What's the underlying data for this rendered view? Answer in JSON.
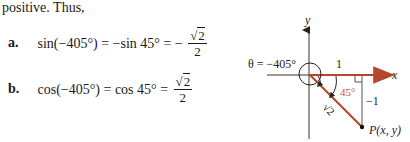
{
  "text": {
    "intro": "positive. Thus,",
    "equations": [
      {
        "label": "a.",
        "lhs": "sin(−405°) = −sin 45° = −",
        "frac_num_radical": "√",
        "frac_num_value": "2",
        "frac_den": "2"
      },
      {
        "label": "b.",
        "lhs": "cos(−405°) = cos 45° = ",
        "frac_num_radical": "√",
        "frac_num_value": "2",
        "frac_den": "2"
      }
    ]
  },
  "figure": {
    "theta_label": "θ = −405°",
    "x_axis_label": "x",
    "y_axis_label": "y",
    "horizontal_leg_label": "1",
    "vertical_leg_label": "−1",
    "hypotenuse_label": "√2",
    "angle_label": "45°",
    "point_label": "P(x, y)",
    "colors": {
      "accent": "#b5472c",
      "axis": "#333333",
      "angle_text": "#c9503a"
    }
  }
}
